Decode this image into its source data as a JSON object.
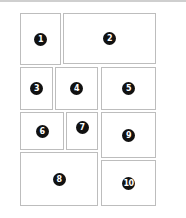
{
  "layout": {
    "boxes": [
      {
        "label": "1"
      },
      {
        "label": "2"
      },
      {
        "label": "3"
      },
      {
        "label": "4"
      },
      {
        "label": "5"
      },
      {
        "label": "6"
      },
      {
        "label": "7"
      },
      {
        "label": "8"
      },
      {
        "label": "9"
      },
      {
        "label": "10"
      }
    ]
  },
  "colors": {
    "border": "#bdbdbd",
    "badge": "#111111",
    "badge_text": "#ffffff"
  }
}
